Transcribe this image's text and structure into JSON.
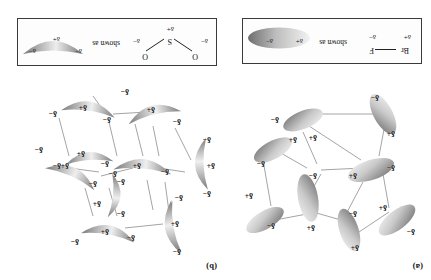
{
  "figure": {
    "background_color": "#ffffff",
    "orientation_note": "rotated-180",
    "symbols": {
      "delta_plus": "δ+",
      "delta_minus": "δ−",
      "shown_as": "shown as"
    }
  },
  "panels": [
    {
      "id": "a",
      "caption": "(a)",
      "molecule": "BrF",
      "shape": "ellipse",
      "legend": {
        "atom_left": "Br",
        "atom_right": "F",
        "charge_left": "δ+",
        "charge_right": "δ−",
        "connector": "shown as",
        "swatch_charge_plus": "δ+",
        "swatch_charge_minus": "δ−"
      },
      "units": [
        {
          "plus": "δ+",
          "minus": "δ−"
        },
        {
          "plus": "δ+",
          "minus": "δ−"
        },
        {
          "plus": "δ+",
          "minus": "δ−"
        },
        {
          "plus": "δ+",
          "minus": "δ−"
        },
        {
          "plus": "δ+",
          "minus": "δ−"
        },
        {
          "plus": "δ+",
          "minus": "δ−"
        },
        {
          "plus": "δ+",
          "minus": "δ−"
        },
        {
          "plus": "δ+",
          "minus": "δ−"
        }
      ]
    },
    {
      "id": "b",
      "caption": "(b)",
      "molecule": "SO2",
      "shape": "crescent",
      "legend": {
        "atom_center": "S",
        "atom_end_1": "O",
        "atom_end_2": "O",
        "charge_center": "δ+",
        "charge_end_1": "δ−",
        "charge_end_2": "δ−",
        "connector": "shown as",
        "swatch_charge_plus": "δ+",
        "swatch_charge_minus_1": "δ−",
        "swatch_charge_minus_2": "δ−"
      },
      "units": [
        {
          "plus": "δ+",
          "minus_1": "δ−",
          "minus_2": "δ−"
        },
        {
          "plus": "δ+",
          "minus_1": "δ−",
          "minus_2": "δ−"
        },
        {
          "plus": "δ+",
          "minus_1": "δ−",
          "minus_2": "δ−"
        },
        {
          "plus": "δ+",
          "minus_1": "δ−",
          "minus_2": "δ−"
        },
        {
          "plus": "δ+",
          "minus_1": "δ−",
          "minus_2": "δ−"
        },
        {
          "plus": "δ+",
          "minus_1": "δ−",
          "minus_2": "δ−"
        },
        {
          "plus": "δ+",
          "minus_1": "δ−",
          "minus_2": "δ−"
        },
        {
          "plus": "δ+",
          "minus_1": "δ−",
          "minus_2": "δ−"
        },
        {
          "plus": "δ+",
          "minus_1": "δ−",
          "minus_2": "δ−"
        }
      ]
    }
  ],
  "colors": {
    "line": "#8d8d8d",
    "border": "#3a3a3a",
    "dipole_dark": "#7b7b7b",
    "dipole_light": "#ededed",
    "text": "#101010"
  }
}
